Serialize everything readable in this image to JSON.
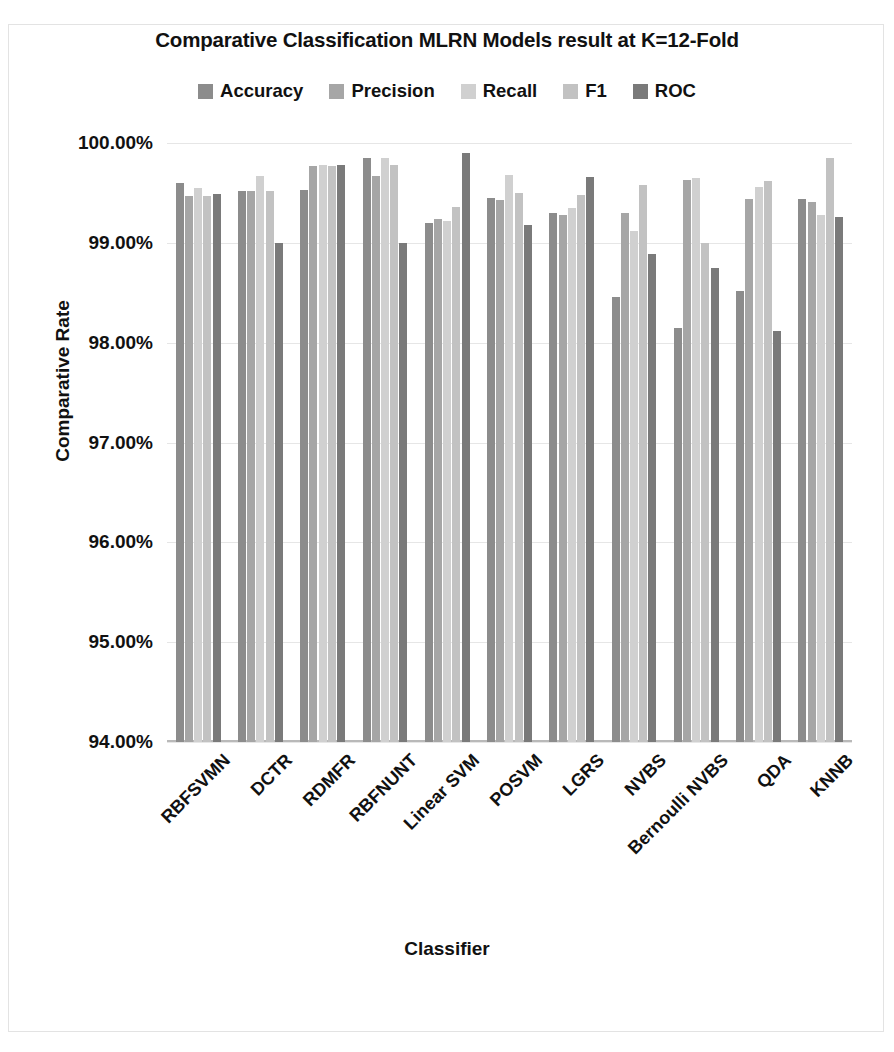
{
  "chart_data": {
    "type": "bar",
    "title": "Comparative Classification MLRN Models result  at K=12-Fold",
    "xlabel": "Classifier",
    "ylabel": "Comparative Rate",
    "ylim": [
      94.0,
      100.0
    ],
    "ytick_labels": [
      "100.00%",
      "99.00%",
      "98.00%",
      "97.00%",
      "96.00%",
      "95.00%",
      "94.00%"
    ],
    "ytick_values": [
      100.0,
      99.0,
      98.0,
      97.0,
      96.0,
      95.0,
      94.0
    ],
    "grid": true,
    "legend_position": "top",
    "categories": [
      "RBFSVMN",
      "DCTR",
      "RDMFR",
      "RBFNUNT",
      "Linear SVM",
      "POSVM",
      "LGRS",
      "NVBS",
      "Bernoulli NVBS",
      "QDA",
      "KNNB"
    ],
    "series": [
      {
        "name": "Accuracy",
        "color": "#8c8c8c",
        "values": [
          99.6,
          99.52,
          99.53,
          99.85,
          99.2,
          99.45,
          99.3,
          98.46,
          98.15,
          98.52,
          99.44
        ]
      },
      {
        "name": "Precision",
        "color": "#a6a6a6",
        "values": [
          99.47,
          99.52,
          99.77,
          99.67,
          99.24,
          99.43,
          99.28,
          99.3,
          99.63,
          99.44,
          99.41
        ]
      },
      {
        "name": "Recall",
        "color": "#d0d0d0",
        "values": [
          99.55,
          99.67,
          99.78,
          99.85,
          99.22,
          99.68,
          99.35,
          99.12,
          99.65,
          99.56,
          99.28
        ]
      },
      {
        "name": "F1",
        "color": "#c2c2c2",
        "values": [
          99.47,
          99.52,
          99.77,
          99.78,
          99.36,
          99.5,
          99.48,
          99.58,
          99.0,
          99.62,
          99.85
        ]
      },
      {
        "name": "ROC",
        "color": "#7a7a7a",
        "values": [
          99.49,
          99.0,
          99.78,
          99.0,
          99.9,
          99.18,
          99.66,
          98.89,
          98.75,
          98.12,
          99.26
        ]
      }
    ]
  },
  "title_text": "Comparative Classification MLRN Models result  at K=12-Fold",
  "axis": {
    "y_title": "Comparative Rate",
    "x_title": "Classifier"
  }
}
